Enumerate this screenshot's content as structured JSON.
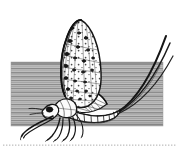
{
  "figure": {
    "title": "Mayfly resting on a hatched band",
    "subject": "mayfly",
    "style": "pen-and-ink engraving",
    "background_color": "#ffffff",
    "ink_color": "#1a1a1a",
    "band": {
      "name": "hatched-ground-band",
      "fill_color": "#b9b9b9",
      "hatch_color": "#8f8f8f",
      "x": 11,
      "y": 62,
      "width": 152,
      "height": 64
    },
    "baseline_rule": {
      "name": "dotted-baseline",
      "color": "#c9c9c9",
      "y": 145,
      "x_start": 2,
      "x_end": 177
    },
    "parts": [
      {
        "name": "forewing",
        "label": "Forewing",
        "note": "upright, mottled with dark spots"
      },
      {
        "name": "hindwing",
        "label": "Hindwing",
        "note": "smaller, celled, below forewing"
      },
      {
        "name": "thorax",
        "label": "Thorax"
      },
      {
        "name": "head",
        "label": "Head"
      },
      {
        "name": "abdomen",
        "label": "Abdomen",
        "note": "segmented, curving upward"
      },
      {
        "name": "cerci",
        "label": "Tail filaments",
        "count": 3
      },
      {
        "name": "legs",
        "label": "Legs",
        "count": 6
      }
    ]
  }
}
